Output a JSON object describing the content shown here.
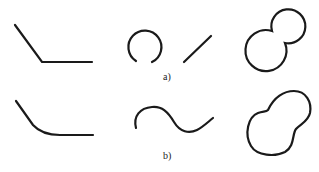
{
  "figure": {
    "stroke_color": "#1a1a1a",
    "background_color": "#ffffff",
    "rows": [
      {
        "label": "a)",
        "shapes": [
          {
            "name": "sharp-corner-polyline",
            "type": "polyline"
          },
          {
            "name": "open-arc-and-separate-line",
            "type": "arc+line"
          },
          {
            "name": "two-overlapping-circles-union",
            "type": "closed-outline"
          }
        ]
      },
      {
        "label": "b)",
        "shapes": [
          {
            "name": "rounded-corner-polyline",
            "type": "smooth-curve"
          },
          {
            "name": "smooth-s-curve",
            "type": "smooth-curve"
          },
          {
            "name": "smooth-peanut-outline",
            "type": "closed-outline"
          }
        ]
      }
    ]
  }
}
